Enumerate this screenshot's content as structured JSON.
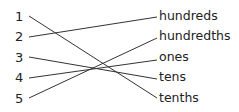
{
  "numbers": [
    {
      "label": "1",
      "y": 10
    },
    {
      "label": "2",
      "y": 30
    },
    {
      "label": "3",
      "y": 51
    },
    {
      "label": "4",
      "y": 71
    },
    {
      "label": "5",
      "y": 92
    }
  ],
  "words": [
    {
      "label": "hundreds",
      "y": 10
    },
    {
      "label": "hundredths",
      "y": 30
    },
    {
      "label": "ones",
      "y": 51
    },
    {
      "label": "tens",
      "y": 71
    },
    {
      "label": "tenths",
      "y": 92
    }
  ],
  "connections": [
    {
      "from": "1",
      "to": "tenths"
    },
    {
      "from": "2",
      "to": "hundreds"
    },
    {
      "from": "3",
      "to": "tens"
    },
    {
      "from": "4",
      "to": "ones"
    },
    {
      "from": "5",
      "to": "hundredths"
    }
  ],
  "line_color": "#333333"
}
